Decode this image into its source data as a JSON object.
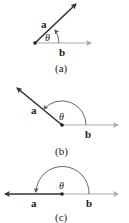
{
  "colors": {
    "vector_a": "#333333",
    "vector_b": "#aaaaaa",
    "arc": "#555555",
    "dot": "#222222"
  },
  "panels": [
    {
      "caption": "(a)",
      "vector_a_label": "a",
      "vector_b_label": "b",
      "angle_label": "θ",
      "description": "acute angle between a and b"
    },
    {
      "caption": "(b)",
      "vector_a_label": "a",
      "vector_b_label": "b",
      "angle_label": "θ",
      "description": "obtuse angle between a and b"
    },
    {
      "caption": "(c)",
      "vector_a_label": "a",
      "vector_b_label": "b",
      "angle_label": "θ",
      "description": "straight angle (180°) between a and b"
    }
  ]
}
